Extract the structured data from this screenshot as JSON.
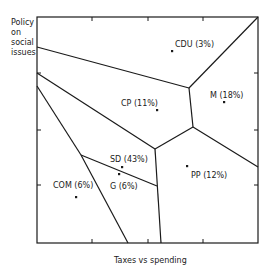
{
  "diagram": {
    "type": "voronoi-partition",
    "y_axis_label": "Policy on social issues",
    "y_axis_label_lines": [
      "Policy",
      "on",
      "social",
      "issues"
    ],
    "x_axis_label": "Taxes vs spending",
    "frame": {
      "x0": 37,
      "y0": 17,
      "x1": 258,
      "y1": 243
    },
    "ticks": {
      "top_x": [
        92,
        148,
        203
      ],
      "bottom_x": [
        92,
        148,
        203
      ],
      "left_y": [
        73,
        130,
        185
      ],
      "right_y": [
        73,
        130,
        185
      ]
    },
    "parties": [
      {
        "name": "CDU",
        "share": "3%",
        "label": "CDU (3%)",
        "dot": [
          172,
          51
        ],
        "label_pos": [
          175,
          40
        ]
      },
      {
        "name": "CP",
        "share": "11%",
        "label": "CP (11%)",
        "dot": [
          157,
          110
        ],
        "label_pos": [
          121,
          99
        ]
      },
      {
        "name": "M",
        "share": "18%",
        "label": "M (18%)",
        "dot": [
          224,
          102
        ],
        "label_pos": [
          210,
          91
        ]
      },
      {
        "name": "SD",
        "share": "43%",
        "label": "SD (43%)",
        "dot": [
          122,
          167
        ],
        "label_pos": [
          110,
          155
        ]
      },
      {
        "name": "G",
        "share": "6%",
        "label": "G (6%)",
        "dot": [
          119,
          174
        ],
        "label_pos": [
          110,
          182
        ]
      },
      {
        "name": "PP",
        "share": "12%",
        "label": "PP (12%)",
        "dot": [
          187,
          166
        ],
        "label_pos": [
          191,
          171
        ]
      },
      {
        "name": "COM",
        "share": "6%",
        "label": "COM (6%)",
        "dot": [
          76,
          197
        ],
        "label_pos": [
          53,
          181
        ]
      }
    ],
    "boundaries": [
      [
        [
          37,
          47
        ],
        [
          189,
          88
        ]
      ],
      [
        [
          189,
          88
        ],
        [
          258,
          17
        ]
      ],
      [
        [
          189,
          88
        ],
        [
          193,
          127
        ]
      ],
      [
        [
          193,
          127
        ],
        [
          258,
          167
        ]
      ],
      [
        [
          193,
          127
        ],
        [
          155,
          149
        ]
      ],
      [
        [
          37,
          73
        ],
        [
          155,
          149
        ]
      ],
      [
        [
          155,
          149
        ],
        [
          161,
          243
        ]
      ],
      [
        [
          37,
          86
        ],
        [
          81,
          155
        ]
      ],
      [
        [
          81,
          155
        ],
        [
          128,
          243
        ]
      ],
      [
        [
          81,
          155
        ],
        [
          157,
          186
        ]
      ]
    ],
    "colors": {
      "line": "#1a1a1a",
      "background": "#ffffff"
    }
  }
}
